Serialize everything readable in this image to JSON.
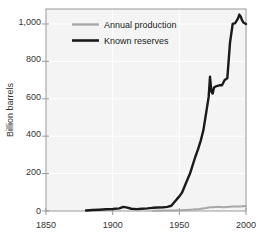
{
  "chart_data": {
    "type": "line",
    "title": "",
    "subtitle": "",
    "xlabel": "",
    "ylabel": "Billion barrels",
    "xlim": [
      1850,
      2000
    ],
    "ylim": [
      0,
      1080
    ],
    "xticks": [
      "1850",
      "1900",
      "1950",
      "2000"
    ],
    "xtick_values": [
      1850,
      1900,
      1950,
      2000
    ],
    "yticks": [
      "0",
      "200",
      "400",
      "600",
      "800",
      "1,000"
    ],
    "ytick_values": [
      0,
      200,
      400,
      600,
      800,
      1000
    ],
    "grid": true,
    "legend_position": "top-left",
    "series": [
      {
        "name": "Annual production",
        "color": "#a8a8a8",
        "width": 2.0,
        "x": [
          1930,
          1940,
          1945,
          1950,
          1955,
          1960,
          1965,
          1970,
          1973,
          1975,
          1979,
          1983,
          1986,
          1990,
          1995,
          2000
        ],
        "values": [
          1.5,
          2.5,
          3.0,
          4.0,
          5.5,
          7.5,
          11.0,
          16.5,
          20.5,
          19.5,
          23.0,
          19.5,
          21.0,
          23.5,
          24.5,
          27.0
        ]
      },
      {
        "name": "Known reserves",
        "color": "#1a1a1a",
        "width": 2.4,
        "x": [
          1880,
          1885,
          1890,
          1895,
          1900,
          1905,
          1908,
          1911,
          1914,
          1918,
          1922,
          1926,
          1930,
          1934,
          1938,
          1941,
          1944,
          1946,
          1948,
          1950,
          1952,
          1955,
          1958,
          1960,
          1962,
          1964,
          1966,
          1968,
          1970,
          1972,
          1973,
          1974,
          1975,
          1976,
          1978,
          1980,
          1982,
          1984,
          1986,
          1988,
          1990,
          1992,
          1994,
          1995,
          1996,
          1997,
          1998,
          2000
        ],
        "values": [
          3,
          5,
          7,
          9,
          11,
          14,
          22,
          18,
          12,
          10,
          12,
          14,
          17,
          19,
          20,
          22,
          28,
          45,
          62,
          78,
          98,
          150,
          200,
          245,
          290,
          330,
          375,
          430,
          520,
          610,
          718,
          640,
          628,
          660,
          668,
          672,
          672,
          700,
          710,
          900,
          1000,
          1005,
          1030,
          1050,
          1040,
          1020,
          1008,
          1000
        ]
      }
    ]
  },
  "legend": {
    "items": [
      {
        "label": "Annual production",
        "color": "#a8a8a8"
      },
      {
        "label": "Known reserves",
        "color": "#1a1a1a"
      }
    ]
  },
  "axes": {
    "y_title": "Billion barrels",
    "y_tick_labels": [
      "1,000",
      "800",
      "600",
      "400",
      "200",
      "0"
    ],
    "x_tick_labels": [
      "1850",
      "1900",
      "1950",
      "2000"
    ]
  },
  "colors": {
    "plot_background": "#f4f4f4",
    "plot_border": "#9a9a9a",
    "grid": "#ffffff",
    "text": "#333333",
    "production_line": "#a8a8a8",
    "reserves_line": "#1a1a1a"
  }
}
